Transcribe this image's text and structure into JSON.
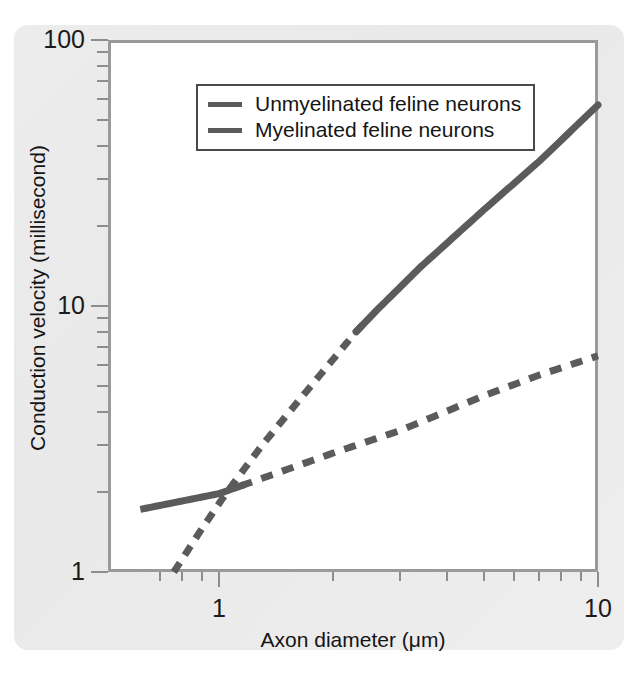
{
  "figure": {
    "background_color": "#ececed",
    "plot_background": "#ffffff",
    "frame_color": "#9a9a9c",
    "line_color": "#5b5b5d"
  },
  "legend": {
    "position": "upper-left-inside",
    "entries": [
      {
        "label": "Unmyelinated feline neurons",
        "style": "solid-swatch",
        "series_key": "unmyelinated"
      },
      {
        "label": "Myelinated feline neurons",
        "style": "solid-swatch",
        "series_key": "myelinated"
      }
    ]
  },
  "axes": {
    "x": {
      "title": "Axon diameter (μm)",
      "scale": "log",
      "min": 0.6,
      "max": 10,
      "major_ticks": [
        {
          "value": 1,
          "label": "1"
        },
        {
          "value": 10,
          "label": "10"
        }
      ],
      "minor_ticks": [
        0.7,
        0.8,
        0.9,
        2,
        3,
        4,
        5,
        6,
        7,
        8,
        9
      ]
    },
    "y": {
      "title": "Conduction velocity (millisecond)",
      "scale": "log",
      "min": 1,
      "max": 100,
      "major_ticks": [
        {
          "value": 1,
          "label": "1"
        },
        {
          "value": 10,
          "label": "10"
        },
        {
          "value": 100,
          "label": "100"
        }
      ],
      "minor_ticks": [
        2,
        3,
        4,
        5,
        6,
        7,
        8,
        9,
        20,
        30,
        40,
        50,
        60,
        70,
        80,
        90
      ]
    }
  },
  "chart_data": {
    "type": "line",
    "title": "",
    "xlabel": "Axon diameter (μm)",
    "ylabel": "Conduction velocity (millisecond)",
    "xscale": "log",
    "yscale": "log",
    "xlim": [
      0.6,
      10
    ],
    "ylim": [
      1,
      100
    ],
    "grid": false,
    "legend_position": "upper-left-inside",
    "series": [
      {
        "name": "Unmyelinated feline neurons",
        "key": "unmyelinated",
        "linestyle": "dashed",
        "color": "#5b5b5d",
        "points": [
          {
            "x": 0.76,
            "y": 1.0
          },
          {
            "x": 0.9,
            "y": 1.45
          },
          {
            "x": 1.05,
            "y": 2.0
          },
          {
            "x": 1.3,
            "y": 3.0
          },
          {
            "x": 1.6,
            "y": 4.3
          },
          {
            "x": 2.0,
            "y": 6.3
          },
          {
            "x": 2.3,
            "y": 8.0
          },
          {
            "x": 2.6,
            "y": 9.6
          },
          {
            "x": 3.4,
            "y": 14.0
          },
          {
            "x": 5.0,
            "y": 23.0
          },
          {
            "x": 7.0,
            "y": 35.0
          },
          {
            "x": 10.0,
            "y": 57.0
          }
        ]
      },
      {
        "name": "Myelinated feline neurons",
        "key": "myelinated",
        "linestyle": "solid-then-dashed",
        "color": "#5b5b5d",
        "points": [
          {
            "x": 0.62,
            "y": 1.72
          },
          {
            "x": 1.0,
            "y": 1.97
          },
          {
            "x": 1.3,
            "y": 2.25
          },
          {
            "x": 2.0,
            "y": 2.8
          },
          {
            "x": 3.0,
            "y": 3.4
          },
          {
            "x": 5.0,
            "y": 4.6
          },
          {
            "x": 7.0,
            "y": 5.5
          },
          {
            "x": 10.0,
            "y": 6.5
          }
        ]
      }
    ],
    "annotations": [
      "Steep curve is dashed between approx. x=0.76 and x=2.3, solid from x=2.3 to x=10",
      "Shallow curve is solid from x=0.62 to x=1.15, dashed from x=1.15 to x=10",
      "The two curves intersect near x=1.07, y=2.0"
    ]
  }
}
